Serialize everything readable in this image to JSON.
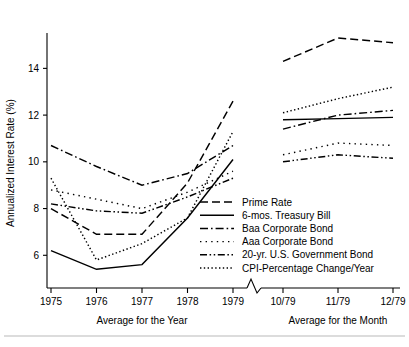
{
  "chart_data": {
    "type": "line",
    "title": "",
    "xlabel": "",
    "ylabel": "Annualized Interest Rate (%)",
    "ylim": [
      4.6,
      15.3
    ],
    "yticks": [
      6,
      8,
      10,
      12,
      14
    ],
    "yticklabels": [
      "6",
      "8",
      "10",
      "12",
      "14"
    ],
    "grid": false,
    "legend_position": "inside-center-right",
    "panels": [
      {
        "name": "Average for the Year",
        "axis_label": "Average for the Year",
        "categories": [
          "1975",
          "1976",
          "1977",
          "1978",
          "1979"
        ]
      },
      {
        "name": "Average for the Month",
        "axis_label": "Average for the Month",
        "categories": [
          "10/79",
          "11/79",
          "12/79"
        ]
      }
    ],
    "axis_break": true,
    "series": [
      {
        "name": "Prime Rate",
        "style": "dashed",
        "year_values": [
          8.0,
          6.9,
          6.9,
          9.1,
          12.6
        ],
        "month_values": [
          14.3,
          15.3,
          15.1
        ]
      },
      {
        "name": "6-mos. Treasury Bill",
        "style": "solid",
        "year_values": [
          6.2,
          5.4,
          5.6,
          7.6,
          10.1
        ],
        "month_values": [
          11.8,
          11.85,
          11.9
        ]
      },
      {
        "name": "Baa Corporate Bond",
        "style": "dash-dot",
        "year_values": [
          10.7,
          9.8,
          9.0,
          9.5,
          10.7
        ],
        "month_values": [
          11.4,
          12.0,
          12.2
        ]
      },
      {
        "name": "Aaa Corporate Bond",
        "style": "dotted-sparse",
        "year_values": [
          8.8,
          8.4,
          8.0,
          8.7,
          9.6
        ],
        "month_values": [
          10.3,
          10.8,
          10.7
        ]
      },
      {
        "name": "20-yr. U.S. Government Bond",
        "style": "dash-dot-dot",
        "year_values": [
          8.2,
          7.9,
          7.8,
          8.5,
          9.3
        ],
        "month_values": [
          10.0,
          10.3,
          10.15
        ]
      },
      {
        "name": "CPI-Percentage Change/Year",
        "style": "dotted",
        "year_values": [
          9.3,
          5.8,
          6.5,
          7.6,
          11.3
        ],
        "month_values": [
          12.1,
          12.7,
          13.2
        ]
      }
    ]
  }
}
